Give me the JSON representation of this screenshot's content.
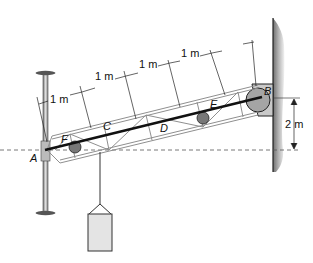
{
  "figure": {
    "clipped_header": "",
    "points": {
      "A": "A",
      "B": "B",
      "C": "C",
      "D": "D",
      "E": "E",
      "F": "F"
    },
    "dimensions": {
      "segment_1": "1 m",
      "segment_2": "1 m",
      "segment_3": "1 m",
      "segment_4": "1 m",
      "height": "2 m"
    },
    "colors": {
      "line": "#222222",
      "truss": "#9a9a9a",
      "wall": "#8c8c8c",
      "weight_fill": "#e4e4e4",
      "cable": "#111111"
    }
  }
}
